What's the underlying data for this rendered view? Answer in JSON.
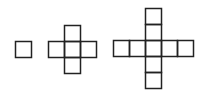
{
  "diagram": {
    "stroke_color": "#222222",
    "background": "#ffffff",
    "cell_size": 16,
    "figures": [
      {
        "name": "figure-1",
        "squares": 1,
        "cells": [
          [
            15,
            41
          ]
        ]
      },
      {
        "name": "figure-2",
        "squares": 5,
        "cells": [
          [
            64,
            25
          ],
          [
            48,
            41
          ],
          [
            64,
            41
          ],
          [
            80,
            41
          ],
          [
            64,
            57
          ]
        ]
      },
      {
        "name": "figure-3",
        "squares": 9,
        "cells": [
          [
            145,
            8
          ],
          [
            145,
            24
          ],
          [
            113,
            40
          ],
          [
            129,
            40
          ],
          [
            145,
            40
          ],
          [
            161,
            40
          ],
          [
            177,
            40
          ],
          [
            145,
            56
          ],
          [
            145,
            72
          ]
        ]
      }
    ]
  }
}
